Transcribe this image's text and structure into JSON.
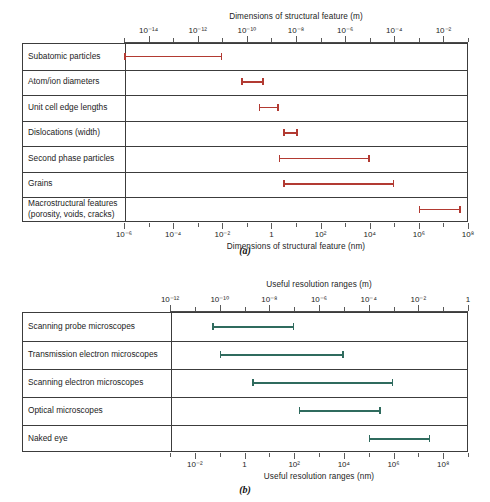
{
  "figure": {
    "captions": {
      "a": "(a)",
      "b": "(b)"
    }
  },
  "chart_data": [
    {
      "id": "a",
      "type": "bar",
      "orientation": "horizontal-range",
      "title": "",
      "top_axis_label": "Dimensions of structural feature (m)",
      "bottom_axis_label": "Dimensions of structural feature (nm)",
      "xlabel": "Dimensions of structural feature (nm)",
      "ylabel": "",
      "grid": true,
      "legend": "none",
      "bar_color": "#b23a32",
      "scale": "log",
      "xlim_nm": [
        1e-06,
        100000000.0
      ],
      "top_axis_unit": "m",
      "bottom_axis_unit": "nm",
      "top_tick_labels": [
        "10⁻¹⁴",
        "10⁻¹²",
        "10⁻¹⁰",
        "10⁻⁸",
        "10⁻⁶",
        "10⁻⁴",
        "10⁻²"
      ],
      "top_tick_exponents": [
        -14,
        -12,
        -10,
        -8,
        -6,
        -4,
        -2
      ],
      "bottom_tick_labels": [
        "10⁻⁶",
        "10⁻⁴",
        "10⁻²",
        "1",
        "10²",
        "10⁴",
        "10⁶",
        "10⁸"
      ],
      "bottom_tick_exponents": [
        -6,
        -4,
        -2,
        0,
        2,
        4,
        6,
        8
      ],
      "categories": [
        "Subatomic particles",
        "Atom/ion diameters",
        "Unit cell edge lengths",
        "Dislocations (width)",
        "Second phase particles",
        "Grains",
        "Macrostructural features\n(porosity, voids, cracks)"
      ],
      "ranges_nm": [
        {
          "label": "Subatomic particles",
          "min": 1e-06,
          "max": 0.01
        },
        {
          "label": "Atom/ion diameters",
          "min": 0.06,
          "max": 0.5
        },
        {
          "label": "Unit cell edge lengths",
          "min": 0.3,
          "max": 2.0
        },
        {
          "label": "Dislocations (width)",
          "min": 3.0,
          "max": 12.0
        },
        {
          "label": "Second phase particles",
          "min": 2.0,
          "max": 10000.0
        },
        {
          "label": "Grains",
          "min": 3.0,
          "max": 100000.0
        },
        {
          "label": "Macrostructural features (porosity, voids, cracks)",
          "min": 1000000.0,
          "max": 50000000.0
        }
      ]
    },
    {
      "id": "b",
      "type": "bar",
      "orientation": "horizontal-range",
      "title": "",
      "top_axis_label": "Useful resolution ranges (m)",
      "bottom_axis_label": "Useful resolution ranges (nm)",
      "xlabel": "Useful resolution ranges (nm)",
      "ylabel": "",
      "grid": true,
      "legend": "none",
      "bar_color": "#2f6b5e",
      "scale": "log",
      "xlim_nm": [
        0.001,
        1000000000.0
      ],
      "top_axis_unit": "m",
      "bottom_axis_unit": "nm",
      "top_tick_labels": [
        "10⁻¹²",
        "10⁻¹⁰",
        "10⁻⁸",
        "10⁻⁶",
        "10⁻⁴",
        "10⁻²",
        "1"
      ],
      "top_tick_exponents": [
        -12,
        -10,
        -8,
        -6,
        -4,
        -2,
        0
      ],
      "bottom_tick_labels": [
        "10⁻²",
        "1",
        "10²",
        "10⁴",
        "10⁶",
        "10⁸"
      ],
      "bottom_tick_exponents": [
        -2,
        0,
        2,
        4,
        6,
        8
      ],
      "categories": [
        "Scanning probe microscopes",
        "Transmission electron microscopes",
        "Scanning electron microscopes",
        "Optical microscopes",
        "Naked eye"
      ],
      "ranges_nm": [
        {
          "label": "Scanning probe microscopes",
          "min": 0.05,
          "max": 100.0
        },
        {
          "label": "Transmission electron microscopes",
          "min": 0.1,
          "max": 10000.0
        },
        {
          "label": "Scanning electron microscopes",
          "min": 2.0,
          "max": 1000000.0
        },
        {
          "label": "Optical microscopes",
          "min": 150.0,
          "max": 300000.0
        },
        {
          "label": "Naked eye",
          "min": 100000.0,
          "max": 30000000.0
        }
      ]
    }
  ]
}
